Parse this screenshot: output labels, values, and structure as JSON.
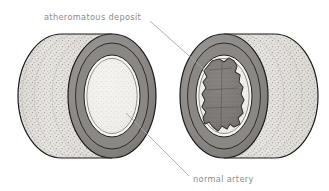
{
  "figure": {
    "background_color": "#ffffff"
  },
  "labels": [
    {
      "id": "atheromatous-deposit",
      "text": "atheromatous deposit",
      "x": 44,
      "y": 20,
      "color": "#8d8d8d",
      "leader_from": [
        150,
        21
      ],
      "leader_to": [
        206,
        71
      ]
    },
    {
      "id": "normal-artery",
      "text": "normal artery",
      "x": 193,
      "y": 182,
      "color": "#8d8d8d",
      "leader_from": [
        126,
        113
      ],
      "leader_to": [
        189,
        176
      ]
    }
  ],
  "illustration": {
    "left_artery": {
      "id": "normal-artery-cylinder",
      "description": "normal artery segment shown in cross-section, open lumen",
      "outline_color": "#1a1a1a",
      "wall_color": "#d8d5d0",
      "media_color": "#8e8c89",
      "intima_color": "#e9e7e3",
      "lumen_color": "#efeeea",
      "center_face": [
        112,
        96
      ],
      "face_rx": 44,
      "face_ry": 62,
      "back_center": [
        62,
        96
      ]
    },
    "right_artery": {
      "id": "diseased-artery-cylinder",
      "description": "artery segment narrowed by an atheromatous deposit",
      "outline_color": "#1a1a1a",
      "wall_color": "#d8d5d0",
      "media_color": "#8e8c89",
      "intima_color": "#e9e7e3",
      "lumen_color": "#efeeea",
      "deposit_color": "#777471",
      "center_face": [
        224,
        96
      ],
      "face_rx": 44,
      "face_ry": 62,
      "back_center": [
        274,
        96
      ]
    },
    "deposit": {
      "id": "atheromatous-plaque",
      "description": "irregular lumpy dark-grey mass occluding the lumen",
      "center": [
        224,
        95
      ],
      "fill": "#7a7775",
      "stroke": "#2a2826"
    }
  },
  "colors": {
    "ink": "#1a1a1a",
    "label_grey": "#8d8d8d",
    "leader_grey": "#a6a6a6",
    "wall_light": "#dedbd6",
    "wall_mid": "#c9c6c1",
    "media_dark": "#8e8c89",
    "media_darker": "#7e7c79",
    "intima_light": "#e7e5e1",
    "lumen_light": "#f1f0ec",
    "deposit": "#7a7775"
  }
}
